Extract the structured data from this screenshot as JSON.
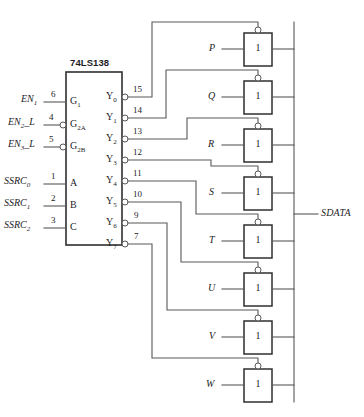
{
  "diagram": {
    "chip": {
      "part_number": "74LS138",
      "inputs": [
        {
          "signal": "EN",
          "signal_sub": "1",
          "pin": "6",
          "port": "G",
          "port_sub": "1",
          "active_low": false
        },
        {
          "signal": "EN",
          "signal_sub": "2",
          "signal_suffix": "_L",
          "pin": "4",
          "port": "G",
          "port_sub": "2A",
          "active_low": true
        },
        {
          "signal": "EN",
          "signal_sub": "3",
          "signal_suffix": "_L",
          "pin": "5",
          "port": "G",
          "port_sub": "2B",
          "active_low": true
        },
        {
          "signal": "SSRC",
          "signal_sub": "0",
          "pin": "1",
          "port": "A",
          "port_sub": "",
          "active_low": false
        },
        {
          "signal": "SSRC",
          "signal_sub": "1",
          "pin": "2",
          "port": "B",
          "port_sub": "",
          "active_low": false
        },
        {
          "signal": "SSRC",
          "signal_sub": "2",
          "pin": "3",
          "port": "C",
          "port_sub": "",
          "active_low": false
        }
      ],
      "outputs": [
        {
          "port": "Y",
          "port_sub": "0",
          "pin": "15"
        },
        {
          "port": "Y",
          "port_sub": "1",
          "pin": "14"
        },
        {
          "port": "Y",
          "port_sub": "2",
          "pin": "13"
        },
        {
          "port": "Y",
          "port_sub": "3",
          "pin": "12"
        },
        {
          "port": "Y",
          "port_sub": "4",
          "pin": "11"
        },
        {
          "port": "Y",
          "port_sub": "5",
          "pin": "10"
        },
        {
          "port": "Y",
          "port_sub": "6",
          "pin": "9"
        },
        {
          "port": "Y",
          "port_sub": "7",
          "pin": "7"
        }
      ]
    },
    "buffers": [
      {
        "data_input": "P",
        "symbol": "1",
        "enable_from": "Y0"
      },
      {
        "data_input": "Q",
        "symbol": "1",
        "enable_from": "Y1"
      },
      {
        "data_input": "R",
        "symbol": "1",
        "enable_from": "Y2"
      },
      {
        "data_input": "S",
        "symbol": "1",
        "enable_from": "Y3"
      },
      {
        "data_input": "T",
        "symbol": "1",
        "enable_from": "Y4"
      },
      {
        "data_input": "U",
        "symbol": "1",
        "enable_from": "Y5"
      },
      {
        "data_input": "V",
        "symbol": "1",
        "enable_from": "Y6"
      },
      {
        "data_input": "W",
        "symbol": "1",
        "enable_from": "Y7"
      }
    ],
    "bus": {
      "label": "SDATA"
    },
    "colors": {
      "wire": "#58585a",
      "outline": "#2f2f31",
      "text": "#1d1d1f",
      "background": "#ffffff"
    }
  }
}
